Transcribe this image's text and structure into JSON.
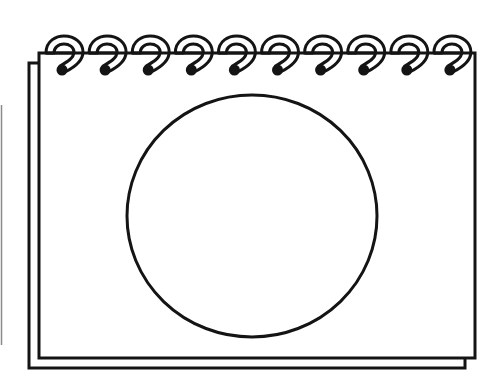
{
  "colors": {
    "background": "#ffffff",
    "stroke": "#141414",
    "edge_line": "#8a8a8a"
  },
  "notepad": {
    "front_page": {
      "x": 38,
      "y": 52,
      "width": 437,
      "height": 306
    },
    "back_page": {
      "x": 28,
      "y": 62,
      "width": 437,
      "height": 306
    },
    "ring_count": 10,
    "ring_first_x": 63,
    "ring_spacing": 43.1,
    "circle": {
      "cx": 252,
      "cy": 216,
      "rx": 125,
      "ry": 121
    }
  }
}
